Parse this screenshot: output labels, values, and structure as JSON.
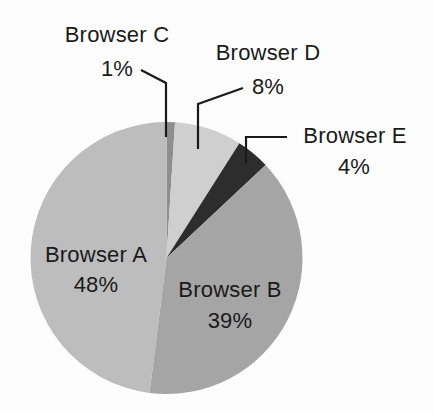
{
  "chart_data": {
    "type": "pie",
    "title": "",
    "categories": [
      "Browser A",
      "Browser B",
      "Browser C",
      "Browser D",
      "Browser E"
    ],
    "values": [
      48,
      39,
      1,
      8,
      4
    ],
    "unit": "%",
    "slices": [
      {
        "name": "Browser C",
        "value": 1,
        "label": "1%",
        "color": "#8e8e8e"
      },
      {
        "name": "Browser D",
        "value": 8,
        "label": "8%",
        "color": "#cfcfcf"
      },
      {
        "name": "Browser E",
        "value": 4,
        "label": "4%",
        "color": "#2d2d2d"
      },
      {
        "name": "Browser B",
        "value": 39,
        "label": "39%",
        "color": "#a5a5a5"
      },
      {
        "name": "Browser A",
        "value": 48,
        "label": "48%",
        "color": "#bdbdbd"
      }
    ],
    "start_angle_deg": 0,
    "direction": "clockwise",
    "legend": "none (direct labels with leader lines)"
  },
  "labels": {
    "a": {
      "name": "Browser A",
      "pct": "48%"
    },
    "b": {
      "name": "Browser B",
      "pct": "39%"
    },
    "c": {
      "name": "Browser C",
      "pct": "1%"
    },
    "d": {
      "name": "Browser D",
      "pct": "8%"
    },
    "e": {
      "name": "Browser E",
      "pct": "4%"
    }
  }
}
